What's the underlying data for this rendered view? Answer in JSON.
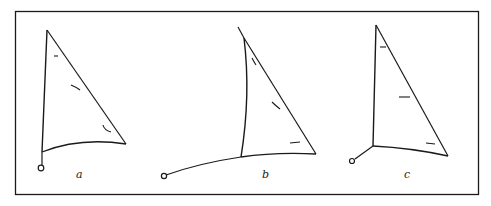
{
  "figure": {
    "panels": [
      {
        "id": "a",
        "label": "a",
        "description": "sail with short tack line, full round foot"
      },
      {
        "id": "b",
        "label": "b",
        "description": "sail with long tack pennant, curved luff"
      },
      {
        "id": "c",
        "label": "c",
        "description": "sail with short diagonal tack line"
      }
    ],
    "stroke_color": "#1a1a1a",
    "background": "#ffffff"
  }
}
